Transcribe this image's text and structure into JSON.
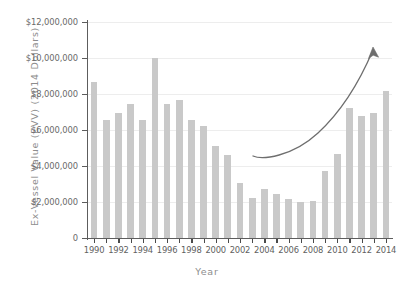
{
  "chart_data": {
    "type": "bar",
    "title": "",
    "xlabel": "Year",
    "ylabel": "Ex-Vessel Value (EVV) (2014 Dollars)",
    "categories": [
      "1990",
      "1991",
      "1992",
      "1993",
      "1994",
      "1995",
      "1996",
      "1997",
      "1998",
      "1999",
      "2000",
      "2001",
      "2002",
      "2003",
      "2004",
      "2005",
      "2006",
      "2007",
      "2008",
      "2009",
      "2010",
      "2011",
      "2012",
      "2013",
      "2014"
    ],
    "values": [
      8650000,
      6550000,
      6950000,
      7450000,
      6550000,
      10000000,
      7450000,
      7650000,
      6550000,
      6200000,
      5100000,
      4600000,
      3050000,
      2200000,
      2700000,
      2450000,
      2150000,
      2000000,
      2050000,
      3750000,
      4650000,
      7250000,
      6800000,
      6950000,
      8150000
    ],
    "ylim": [
      0,
      12000000
    ],
    "ytick_labels": [
      "0",
      "$2,000,000",
      "$4,000,000",
      "$6,000,000",
      "$8,000,000",
      "$10,000,000",
      "$12,000,000"
    ],
    "ytick_values": [
      0,
      2000000,
      4000000,
      6000000,
      8000000,
      10000000,
      12000000
    ],
    "xtick_labels": [
      "1990",
      "1992",
      "1994",
      "1996",
      "1998",
      "2000",
      "2002",
      "2004",
      "2006",
      "2008",
      "2010",
      "2012",
      "2014"
    ],
    "grid": true,
    "legend": "none",
    "annotations": [
      {
        "name": "upward-trend-arrow",
        "type": "curved-arrow",
        "description": "Curved arrow rising from about 2003 to above 2014 indicating increasing trend"
      }
    ],
    "colors": {
      "bar": "#c9c9c9",
      "axis": "#5d5d5d",
      "grid": "#ededed",
      "label": "#6a6a6a",
      "arrow": "#6e6e6e",
      "background": "#ffffff"
    }
  }
}
